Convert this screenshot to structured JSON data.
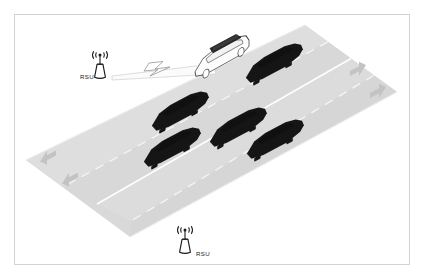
{
  "figure": {
    "kind": "v2x-road-scenario-diagram",
    "title": "",
    "frame_color": "#d2d2d2",
    "background_color": "#ffffff"
  },
  "labels": {
    "rsu_left": "RSU",
    "rsu_bottom": "RSU"
  },
  "road": {
    "surface_color": "#d9d9d9",
    "surface_color_light": "#e2e2e2",
    "surface_color_dark": "#d0d0d0",
    "edge_line_color": "#ffffff",
    "center_line_color": "#ffffff",
    "dashed_line_color": "#f2f2f2",
    "lane_count": 4,
    "direction_groups": [
      {
        "name": "westbound",
        "arrow": "arrow-left",
        "arrow_count": 2,
        "side": "lower-left"
      },
      {
        "name": "eastbound",
        "arrow": "arrow-right",
        "arrow_count": 2,
        "side": "upper-right"
      }
    ],
    "arrow_color": "#bfbfbf"
  },
  "rsus": [
    {
      "id": "rsu-left",
      "label": "RSU",
      "label_side": "left",
      "icon": "rsu-antenna-tower-icon",
      "wave_icon": "radio-wave-icon",
      "color": "#1a1a1a",
      "transmitting": true
    },
    {
      "id": "rsu-bottom",
      "label": "RSU",
      "label_side": "right",
      "icon": "rsu-antenna-tower-icon",
      "wave_icon": "radio-wave-icon",
      "color": "#1a1a1a",
      "transmitting": false
    }
  ],
  "link": {
    "type": "wireless-communication-beam",
    "from": "rsu-left",
    "to": "ego-vehicle",
    "beam_fill": "#fafafa",
    "beam_stroke": "#c8c8c8",
    "bolt_icon": "lightning-bolt-icon",
    "bolt_fill": "#ffffff",
    "bolt_stroke": "#8c8c8c"
  },
  "vehicles": [
    {
      "id": "ego-vehicle",
      "type": "connected-car",
      "color": "#ffffff",
      "outline": "#4d4d4d",
      "roof_sensor": true,
      "roof_color": "#2b2b2b",
      "lane": 3,
      "highlighted": true
    },
    {
      "id": "car-1",
      "type": "vehicle-silhouette",
      "color": "#1a1a1a",
      "lane": 3
    },
    {
      "id": "car-2",
      "type": "vehicle-silhouette",
      "color": "#1a1a1a",
      "lane": 2
    },
    {
      "id": "car-3",
      "type": "vehicle-silhouette",
      "color": "#1a1a1a",
      "lane": 2
    },
    {
      "id": "car-4",
      "type": "vehicle-silhouette",
      "color": "#1a1a1a",
      "lane": 1
    },
    {
      "id": "car-5",
      "type": "vehicle-silhouette",
      "color": "#1a1a1a",
      "lane": 1
    }
  ],
  "counts": {
    "rsu_total": 2,
    "vehicles_total": 6,
    "dark_vehicles": 5,
    "ego_vehicles": 1
  }
}
